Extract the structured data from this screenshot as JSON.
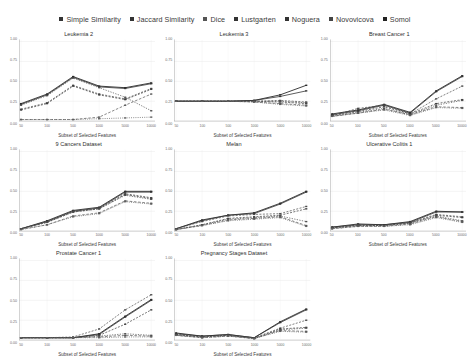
{
  "legend": {
    "position": "top-center",
    "items": [
      {
        "label": "Simple Similarity",
        "color": "#333333"
      },
      {
        "label": "Jaccard Similarity",
        "color": "#333333"
      },
      {
        "label": "Dice",
        "color": "#555555"
      },
      {
        "label": "Lustgarten",
        "color": "#333333"
      },
      {
        "label": "Noguera",
        "color": "#333333"
      },
      {
        "label": "Novovicova",
        "color": "#444444"
      },
      {
        "label": "Somol",
        "color": "#222222"
      }
    ]
  },
  "axes": {
    "xlabel": "Subset of Selected Features",
    "ylabel": "",
    "categories": [
      "50",
      "100",
      "500",
      "1000",
      "5000",
      "10000"
    ],
    "yticks": [
      "0.00",
      "0.25",
      "0.50",
      "0.75",
      "1.00"
    ],
    "ylim": [
      0.0,
      1.0
    ],
    "grid": true
  },
  "chart_data": [
    {
      "type": "line",
      "title": "Leukemia 2",
      "xlabel": "Subset of Selected Features",
      "ylabel": "",
      "categories": [
        "50",
        "100",
        "500",
        "1000",
        "5000",
        "10000"
      ],
      "ylim": [
        0.0,
        1.0
      ],
      "series": [
        {
          "name": "Simple Similarity",
          "values": [
            0.22,
            0.34,
            0.56,
            0.44,
            0.42,
            0.48
          ]
        },
        {
          "name": "Jaccard Similarity",
          "values": [
            0.21,
            0.33,
            0.55,
            0.43,
            0.41,
            0.47
          ]
        },
        {
          "name": "Dice",
          "values": [
            0.15,
            0.23,
            0.45,
            0.34,
            0.28,
            0.41
          ]
        },
        {
          "name": "Lustgarten",
          "values": [
            0.14,
            0.22,
            0.44,
            0.33,
            0.27,
            0.4
          ]
        },
        {
          "name": "Noguera",
          "values": [
            0.2,
            0.32,
            0.54,
            0.42,
            0.3,
            0.13
          ]
        },
        {
          "name": "Novovicova",
          "values": [
            0.02,
            0.02,
            0.02,
            0.05,
            0.2,
            0.34
          ]
        },
        {
          "name": "Somol",
          "values": [
            0.02,
            0.02,
            0.02,
            0.03,
            0.04,
            0.05
          ]
        }
      ]
    },
    {
      "type": "line",
      "title": "Leukemia 3",
      "xlabel": "Subset of Selected Features",
      "ylabel": "",
      "categories": [
        "50",
        "100",
        "500",
        "1000",
        "5000",
        "10000"
      ],
      "ylim": [
        0.0,
        1.0
      ],
      "series": [
        {
          "name": "Simple Similarity",
          "values": [
            0.25,
            0.25,
            0.25,
            0.26,
            0.33,
            0.45
          ]
        },
        {
          "name": "Jaccard Similarity",
          "values": [
            0.25,
            0.25,
            0.25,
            0.26,
            0.31,
            0.38
          ]
        },
        {
          "name": "Dice",
          "values": [
            0.25,
            0.25,
            0.25,
            0.25,
            0.26,
            0.24
          ]
        },
        {
          "name": "Lustgarten",
          "values": [
            0.25,
            0.25,
            0.25,
            0.25,
            0.24,
            0.22
          ]
        },
        {
          "name": "Noguera",
          "values": [
            0.25,
            0.25,
            0.25,
            0.25,
            0.25,
            0.23
          ]
        },
        {
          "name": "Novovicova",
          "values": [
            0.25,
            0.25,
            0.25,
            0.24,
            0.22,
            0.2
          ]
        },
        {
          "name": "Somol",
          "values": [
            0.25,
            0.25,
            0.25,
            0.24,
            0.21,
            0.19
          ]
        }
      ]
    },
    {
      "type": "line",
      "title": "Breast Cancer 1",
      "xlabel": "Subset of Selected Features",
      "ylabel": "",
      "categories": [
        "50",
        "100",
        "500",
        "1000",
        "5000",
        "10000"
      ],
      "ylim": [
        0.0,
        1.0
      ],
      "series": [
        {
          "name": "Simple Similarity",
          "values": [
            0.09,
            0.14,
            0.21,
            0.11,
            0.38,
            0.57
          ]
        },
        {
          "name": "Jaccard Similarity",
          "values": [
            0.08,
            0.13,
            0.2,
            0.1,
            0.37,
            0.56
          ]
        },
        {
          "name": "Dice",
          "values": [
            0.07,
            0.16,
            0.2,
            0.09,
            0.28,
            0.44
          ]
        },
        {
          "name": "Lustgarten",
          "values": [
            0.07,
            0.12,
            0.18,
            0.09,
            0.22,
            0.27
          ]
        },
        {
          "name": "Noguera",
          "values": [
            0.06,
            0.11,
            0.16,
            0.08,
            0.2,
            0.26
          ]
        },
        {
          "name": "Novovicova",
          "values": [
            0.06,
            0.1,
            0.15,
            0.08,
            0.18,
            0.17
          ]
        },
        {
          "name": "Somol",
          "values": [
            0.06,
            0.1,
            0.14,
            0.07,
            0.17,
            0.16
          ]
        }
      ]
    },
    {
      "type": "line",
      "title": "9 Cancers Dataset",
      "xlabel": "Subset of Selected Features",
      "ylabel": "",
      "categories": [
        "50",
        "100",
        "500",
        "1000",
        "5000",
        "10000"
      ],
      "ylim": [
        0.0,
        1.0
      ],
      "series": [
        {
          "name": "Simple Similarity",
          "values": [
            0.03,
            0.13,
            0.26,
            0.3,
            0.5,
            0.5
          ]
        },
        {
          "name": "Jaccard Similarity",
          "values": [
            0.03,
            0.12,
            0.25,
            0.29,
            0.49,
            0.49
          ]
        },
        {
          "name": "Dice",
          "values": [
            0.03,
            0.12,
            0.25,
            0.29,
            0.47,
            0.42
          ]
        },
        {
          "name": "Lustgarten",
          "values": [
            0.03,
            0.11,
            0.24,
            0.28,
            0.46,
            0.41
          ]
        },
        {
          "name": "Noguera",
          "values": [
            0.03,
            0.11,
            0.24,
            0.28,
            0.45,
            0.4
          ]
        },
        {
          "name": "Novovicova",
          "values": [
            0.02,
            0.08,
            0.19,
            0.23,
            0.38,
            0.35
          ]
        },
        {
          "name": "Somol",
          "values": [
            0.02,
            0.08,
            0.18,
            0.22,
            0.37,
            0.34
          ]
        }
      ]
    },
    {
      "type": "line",
      "title": "Melan",
      "xlabel": "Subset of Selected Features",
      "ylabel": "",
      "categories": [
        "50",
        "100",
        "500",
        "1000",
        "5000",
        "10000"
      ],
      "ylim": [
        0.0,
        1.0
      ],
      "series": [
        {
          "name": "Simple Similarity",
          "values": [
            0.03,
            0.14,
            0.2,
            0.23,
            0.35,
            0.5
          ]
        },
        {
          "name": "Jaccard Similarity",
          "values": [
            0.03,
            0.13,
            0.2,
            0.22,
            0.34,
            0.49
          ]
        },
        {
          "name": "Dice",
          "values": [
            0.03,
            0.12,
            0.19,
            0.21,
            0.22,
            0.31
          ]
        },
        {
          "name": "Lustgarten",
          "values": [
            0.02,
            0.08,
            0.16,
            0.18,
            0.2,
            0.28
          ]
        },
        {
          "name": "Noguera",
          "values": [
            0.02,
            0.08,
            0.15,
            0.17,
            0.19,
            0.12
          ]
        },
        {
          "name": "Novovicova",
          "values": [
            0.02,
            0.07,
            0.14,
            0.16,
            0.18,
            0.07
          ]
        },
        {
          "name": "Somol",
          "values": [
            0.02,
            0.07,
            0.13,
            0.15,
            0.17,
            0.06
          ]
        }
      ]
    },
    {
      "type": "line",
      "title": "Ulcerative Colitis 1",
      "xlabel": "Subset of Selected Features",
      "ylabel": "",
      "categories": [
        "50",
        "100",
        "500",
        "1000",
        "5000",
        "10000"
      ],
      "ylim": [
        0.0,
        1.0
      ],
      "series": [
        {
          "name": "Simple Similarity",
          "values": [
            0.05,
            0.09,
            0.08,
            0.12,
            0.25,
            0.24
          ]
        },
        {
          "name": "Jaccard Similarity",
          "values": [
            0.05,
            0.08,
            0.08,
            0.11,
            0.24,
            0.24
          ]
        },
        {
          "name": "Dice",
          "values": [
            0.04,
            0.08,
            0.07,
            0.11,
            0.21,
            0.18
          ]
        },
        {
          "name": "Lustgarten",
          "values": [
            0.04,
            0.07,
            0.07,
            0.1,
            0.2,
            0.17
          ]
        },
        {
          "name": "Noguera",
          "values": [
            0.04,
            0.07,
            0.07,
            0.1,
            0.19,
            0.13
          ]
        },
        {
          "name": "Novovicova",
          "values": [
            0.03,
            0.06,
            0.06,
            0.09,
            0.18,
            0.12
          ]
        },
        {
          "name": "Somol",
          "values": [
            0.03,
            0.06,
            0.06,
            0.08,
            0.17,
            0.11
          ]
        }
      ]
    },
    {
      "type": "line",
      "title": "Prostate Cancer 1",
      "xlabel": "Subset of Selected Features",
      "ylabel": "",
      "categories": [
        "50",
        "100",
        "500",
        "1000",
        "5000",
        "10000"
      ],
      "ylim": [
        0.0,
        1.0
      ],
      "series": [
        {
          "name": "Simple Similarity",
          "values": [
            0.03,
            0.03,
            0.03,
            0.08,
            0.3,
            0.51
          ]
        },
        {
          "name": "Jaccard Similarity",
          "values": [
            0.03,
            0.03,
            0.03,
            0.07,
            0.29,
            0.5
          ]
        },
        {
          "name": "Dice",
          "values": [
            0.03,
            0.03,
            0.04,
            0.14,
            0.38,
            0.57
          ]
        },
        {
          "name": "Lustgarten",
          "values": [
            0.03,
            0.03,
            0.03,
            0.06,
            0.2,
            0.38
          ]
        },
        {
          "name": "Noguera",
          "values": [
            0.03,
            0.03,
            0.03,
            0.05,
            0.08,
            0.06
          ]
        },
        {
          "name": "Novovicova",
          "values": [
            0.03,
            0.03,
            0.03,
            0.04,
            0.06,
            0.05
          ]
        },
        {
          "name": "Somol",
          "values": [
            0.03,
            0.03,
            0.03,
            0.03,
            0.04,
            0.04
          ]
        }
      ]
    },
    {
      "type": "line",
      "title": "Pregnancy Stages Dataset",
      "xlabel": "Subset of Selected Features",
      "ylabel": "",
      "categories": [
        "50",
        "100",
        "500",
        "1000",
        "5000",
        "10000"
      ],
      "ylim": [
        0.0,
        1.0
      ],
      "series": [
        {
          "name": "Simple Similarity",
          "values": [
            0.09,
            0.05,
            0.07,
            0.03,
            0.23,
            0.39
          ]
        },
        {
          "name": "Jaccard Similarity",
          "values": [
            0.08,
            0.05,
            0.07,
            0.03,
            0.22,
            0.38
          ]
        },
        {
          "name": "Dice",
          "values": [
            0.07,
            0.04,
            0.06,
            0.03,
            0.15,
            0.25
          ]
        },
        {
          "name": "Lustgarten",
          "values": [
            0.07,
            0.04,
            0.06,
            0.02,
            0.14,
            0.16
          ]
        },
        {
          "name": "Noguera",
          "values": [
            0.06,
            0.04,
            0.06,
            0.02,
            0.13,
            0.15
          ]
        },
        {
          "name": "Novovicova",
          "values": [
            0.06,
            0.03,
            0.05,
            0.02,
            0.12,
            0.11
          ]
        },
        {
          "name": "Somol",
          "values": [
            0.06,
            0.03,
            0.05,
            0.02,
            0.11,
            0.1
          ]
        }
      ]
    }
  ]
}
